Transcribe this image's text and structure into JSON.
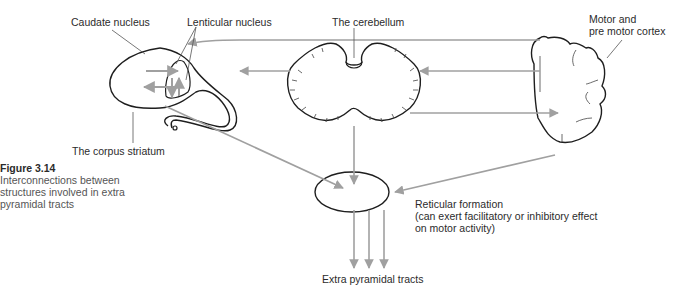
{
  "figure": {
    "number": "Figure 3.14",
    "caption": "Interconnections between structures involved in extra pyramidal tracts"
  },
  "labels": {
    "caudate": "Caudate nucleus",
    "lenticular": "Lenticular nucleus",
    "cerebellum": "The cerebellum",
    "motor_cortex_line1": "Motor and",
    "motor_cortex_line2": "pre motor cortex",
    "corpus_striatum": "The corpus striatum",
    "reticular_line1": "Reticular formation",
    "reticular_line2": "(can exert facilitatory or inhibitory effect",
    "reticular_line3": "on motor activity)",
    "extra_pyramidal": "Extra pyramidal tracts"
  },
  "colors": {
    "outline": "#1e1e1e",
    "arrow": "#a0a0a0",
    "leader": "#555555"
  }
}
